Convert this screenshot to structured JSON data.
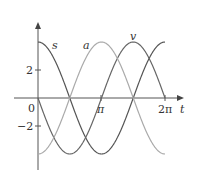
{
  "chart_data": {
    "type": "line",
    "title": "",
    "xlabel": "t",
    "ylabel": "",
    "x_ticks": [
      "0",
      "π",
      "2π"
    ],
    "y_ticks": [
      "2",
      "−2"
    ],
    "xlim": [
      0,
      6.2832
    ],
    "ylim": [
      -4,
      4
    ],
    "grid": false,
    "legend": "inline labels",
    "series": [
      {
        "name": "s",
        "formula": "4cos(t)",
        "color": "#555555",
        "x": [
          0,
          1.5708,
          3.1416,
          4.7124,
          6.2832
        ],
        "values": [
          4,
          0,
          -4,
          0,
          4
        ]
      },
      {
        "name": "v",
        "formula": "-4sin(t)",
        "color": "#666666",
        "x": [
          0,
          1.5708,
          3.1416,
          4.7124,
          6.2832
        ],
        "values": [
          0,
          -4,
          0,
          4,
          0
        ]
      },
      {
        "name": "a",
        "formula": "-4cos(t)",
        "color": "#aaaaaa",
        "x": [
          0,
          1.5708,
          3.1416,
          4.7124,
          6.2832
        ],
        "values": [
          -4,
          0,
          4,
          0,
          -4
        ]
      }
    ]
  },
  "labels": {
    "s": "s",
    "a": "a",
    "v": "v",
    "t": "t",
    "zero": "0",
    "pi": "π",
    "two_pi": "2π",
    "y_pos": "2",
    "y_neg": "−2"
  }
}
